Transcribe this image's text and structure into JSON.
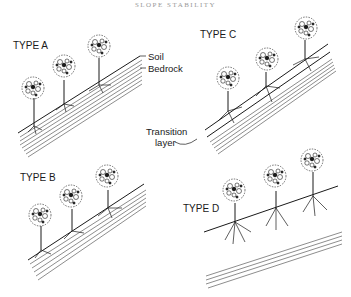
{
  "header": {
    "title": "SLOPE STABILITY"
  },
  "panels": [
    {
      "id": "A",
      "label": "TYPE A"
    },
    {
      "id": "B",
      "label": "TYPE B"
    },
    {
      "id": "C",
      "label": "TYPE C"
    },
    {
      "id": "D",
      "label": "TYPE D"
    }
  ],
  "callouts": {
    "soil": "Soil",
    "bedrock": "Bedrock",
    "transition": "Transition",
    "transition_line2": "layer"
  },
  "colors": {
    "ink": "#1a1a1a",
    "background": "#ffffff"
  }
}
